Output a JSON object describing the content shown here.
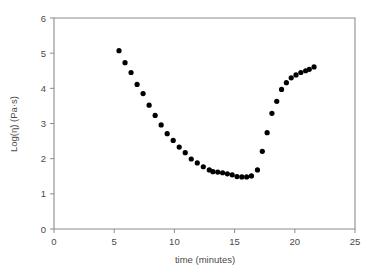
{
  "chart_data": {
    "type": "scatter",
    "title": "",
    "xlabel": "time (minutes)",
    "ylabel": "Log(η) (Pa·s)",
    "xlim": [
      0,
      25
    ],
    "ylim": [
      0,
      6
    ],
    "xticks": [
      0,
      5,
      10,
      15,
      20,
      25
    ],
    "yticks": [
      0,
      1,
      2,
      3,
      4,
      5,
      6
    ],
    "xtick_labels": [
      "0",
      "5",
      "10",
      "15",
      "20",
      "25"
    ],
    "ytick_labels": [
      "0",
      "1",
      "2",
      "3",
      "4",
      "5",
      "6"
    ],
    "grid": false,
    "legend": false,
    "marker": "filled-circle",
    "marker_color": "#000000",
    "marker_size_px": 4.6,
    "frame_color": "#8c8c8c",
    "background": "#ffffff",
    "series": [
      {
        "name": "Log(η) vs time",
        "x": [
          5.4,
          5.9,
          6.4,
          6.9,
          7.4,
          7.9,
          8.4,
          8.9,
          9.4,
          9.9,
          10.4,
          10.9,
          11.4,
          11.9,
          12.4,
          12.9,
          13.2,
          13.6,
          14.0,
          14.4,
          14.8,
          15.2,
          15.6,
          16.0,
          16.4,
          16.9,
          17.3,
          17.7,
          18.1,
          18.5,
          18.9,
          19.3,
          19.7,
          20.1,
          20.5,
          20.9,
          21.2,
          21.6
        ],
        "y": [
          5.07,
          4.73,
          4.45,
          4.11,
          3.85,
          3.52,
          3.23,
          2.96,
          2.71,
          2.52,
          2.33,
          2.17,
          1.99,
          1.88,
          1.77,
          1.68,
          1.63,
          1.62,
          1.6,
          1.57,
          1.54,
          1.49,
          1.48,
          1.48,
          1.51,
          1.68,
          2.21,
          2.74,
          3.29,
          3.63,
          3.97,
          4.16,
          4.3,
          4.38,
          4.45,
          4.5,
          4.54,
          4.61
        ]
      }
    ]
  }
}
